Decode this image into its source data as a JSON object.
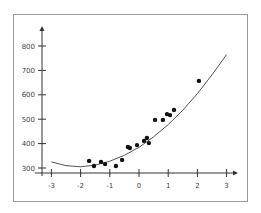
{
  "chart_data": {
    "type": "scatter",
    "title": "",
    "xlabel": "",
    "ylabel": "",
    "xlim": [
      -3,
      3
    ],
    "ylim": [
      300,
      850
    ],
    "x_ticks": [
      -3,
      -2,
      -1,
      0,
      1,
      2,
      3
    ],
    "y_ticks": [
      300,
      400,
      500,
      600,
      700,
      800
    ],
    "x_tick_labels": [
      "-3",
      "-2",
      "-1",
      "0",
      "1",
      "2",
      "3"
    ],
    "y_tick_labels": [
      "300",
      "400",
      "500",
      "600",
      "700",
      "800"
    ],
    "grid": false,
    "legend": null,
    "series": [
      {
        "name": "data points",
        "type": "scatter",
        "x": [
          -1.71,
          -1.54,
          -1.3,
          -1.16,
          -0.79,
          -0.58,
          -0.38,
          -0.31,
          -0.07,
          0.17,
          0.27,
          0.34,
          0.55,
          0.82,
          0.96,
          1.06,
          1.2,
          2.05
        ],
        "y": [
          329,
          308,
          325,
          316,
          308,
          333,
          386,
          382,
          394,
          411,
          423,
          402,
          497,
          497,
          521,
          517,
          538,
          657
        ]
      },
      {
        "name": "quadratic fit",
        "type": "line",
        "x": [
          -3.0,
          -2.5,
          -2.0,
          -1.5,
          -1.0,
          -0.5,
          0.0,
          0.5,
          1.0,
          1.5,
          2.0,
          2.5,
          3.0
        ],
        "y": [
          325,
          310,
          305,
          312,
          328,
          352,
          385,
          428,
          478,
          537,
          605,
          682,
          765
        ]
      }
    ]
  }
}
